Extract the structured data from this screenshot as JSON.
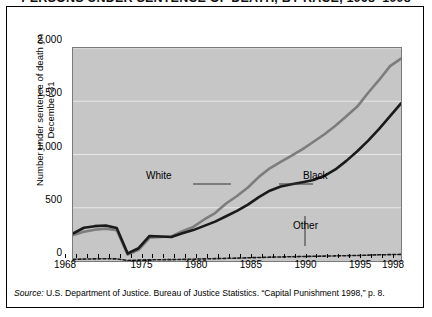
{
  "title": "PERSONS UNDER SENTENCE OF DEATH, BY RACE, 1968–1998",
  "source": {
    "prefix": "Source:",
    "text": "U.S. Department of Justice. Bureau of Justice Statistics. “Capital Punishment 1998,” p. 8."
  },
  "colors": {
    "white_series": "#7d7d7d",
    "black_series": "#1a1a1a",
    "other_series": "#1a1a1a",
    "plot_background": "#c6c6c6",
    "gridline": "#e8e8e8",
    "frame": "#000000"
  },
  "annotations": {
    "white": "White",
    "black": "Black",
    "other": "Other"
  },
  "chart_data": {
    "type": "line",
    "title": "PERSONS UNDER SENTENCE OF DEATH, BY RACE, 1968–1998",
    "xlabel": "",
    "ylabel": "Number under sentence of death on December 31",
    "xlim": [
      1968,
      1998
    ],
    "ylim": [
      0,
      2000
    ],
    "yticks": [
      0,
      500,
      1000,
      1500,
      2000
    ],
    "ytick_labels": [
      "0",
      "500",
      "1,000",
      "1,500",
      "2,000"
    ],
    "xticks": [
      1968,
      1975,
      1980,
      1985,
      1990,
      1995,
      1998
    ],
    "xtick_labels": [
      "1968",
      "1975",
      "1980",
      "1985",
      "1990",
      "1995",
      "1998"
    ],
    "grid": true,
    "legend": "inline-annotations",
    "x": [
      1968,
      1969,
      1970,
      1971,
      1972,
      1973,
      1974,
      1975,
      1976,
      1977,
      1978,
      1979,
      1980,
      1981,
      1982,
      1983,
      1984,
      1985,
      1986,
      1987,
      1988,
      1989,
      1990,
      1991,
      1992,
      1993,
      1994,
      1995,
      1996,
      1997,
      1998
    ],
    "series": [
      {
        "name": "White",
        "color": "#7d7d7d",
        "style": "solid",
        "values": [
          243,
          275,
          293,
          304,
          290,
          60,
          105,
          218,
          225,
          230,
          280,
          320,
          390,
          450,
          540,
          610,
          690,
          790,
          870,
          930,
          990,
          1050,
          1120,
          1190,
          1270,
          1360,
          1450,
          1580,
          1700,
          1830,
          1900
        ]
      },
      {
        "name": "Black",
        "color": "#1a1a1a",
        "style": "solid",
        "values": [
          258,
          312,
          327,
          333,
          310,
          70,
          120,
          235,
          230,
          225,
          260,
          290,
          330,
          370,
          420,
          470,
          530,
          600,
          660,
          700,
          720,
          740,
          760,
          800,
          860,
          940,
          1030,
          1130,
          1240,
          1360,
          1480
        ]
      },
      {
        "name": "Other",
        "color": "#1a1a1a",
        "style": "dashed",
        "values": [
          16,
          18,
          20,
          21,
          20,
          5,
          8,
          12,
          12,
          13,
          15,
          17,
          20,
          22,
          25,
          27,
          30,
          33,
          36,
          38,
          40,
          42,
          44,
          46,
          48,
          50,
          52,
          55,
          58,
          60,
          62
        ]
      }
    ]
  }
}
